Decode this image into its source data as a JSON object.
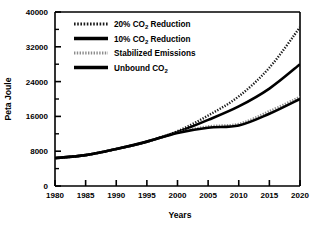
{
  "chart_data": {
    "type": "line",
    "title": "",
    "xlabel": "Years",
    "ylabel": "Peta Joule",
    "xlim": [
      1980,
      2020
    ],
    "ylim": [
      0,
      40000
    ],
    "xticks": [
      1980,
      1985,
      1990,
      1995,
      2000,
      2005,
      2010,
      2015,
      2020
    ],
    "yticks": [
      0,
      8000,
      16000,
      24000,
      32000,
      40000
    ],
    "yticks_minor": [
      4000,
      12000,
      20000,
      28000,
      36000
    ],
    "grid": false,
    "legend_position": "top-left",
    "x": [
      1980,
      1985,
      1990,
      1995,
      2000,
      2005,
      2010,
      2015,
      2020
    ],
    "series": [
      {
        "name": "20% CO2 Reduction",
        "label_main": "20% CO",
        "label_sub": "2",
        "label_tail": " Reduction",
        "style": "dotted-hatched",
        "color": "#1a1a1a",
        "values": [
          6400,
          7100,
          8500,
          10200,
          12600,
          16200,
          20600,
          27200,
          36500
        ]
      },
      {
        "name": "10% CO2 Reduction",
        "label_main": "10% CO",
        "label_sub": "2",
        "label_tail": " Reduction",
        "style": "thick-solid",
        "color": "#000000",
        "values": [
          6400,
          7100,
          8500,
          10200,
          12400,
          15200,
          18300,
          22400,
          28000
        ]
      },
      {
        "name": "Stabilized Emissions",
        "label_main": "Stabilized Emissions",
        "label_sub": "",
        "label_tail": "",
        "style": "gray-dotted",
        "color": "#8c8c8c",
        "values": [
          6400,
          7100,
          8500,
          10200,
          12300,
          13700,
          14300,
          17200,
          20500
        ]
      },
      {
        "name": "Unbound CO2",
        "label_main": "Unbound CO",
        "label_sub": "2",
        "label_tail": "",
        "style": "thick-solid",
        "color": "#000000",
        "values": [
          6400,
          7100,
          8500,
          10200,
          12200,
          13400,
          13900,
          16600,
          20000
        ]
      }
    ]
  },
  "axis": {
    "ylabel": "Peta Joule",
    "xlabel": "Years",
    "ytick_labels": [
      "0",
      "8000",
      "16000",
      "24000",
      "32000",
      "40000"
    ],
    "xtick_labels": [
      "1980",
      "1985",
      "1990",
      "1995",
      "2000",
      "2005",
      "2010",
      "2015",
      "2020"
    ]
  }
}
